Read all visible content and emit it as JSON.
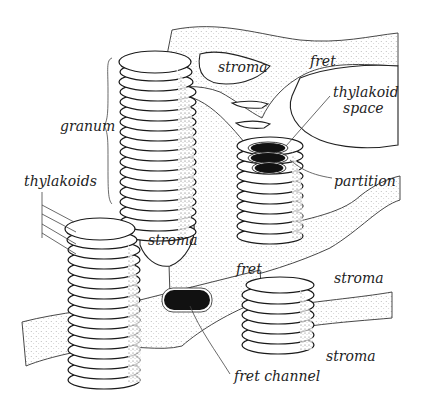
{
  "figure": {
    "labels": {
      "granum": "granum",
      "thylakoids": "thylakoids",
      "stroma_top": "stroma",
      "fret_top": "fret",
      "thylakoid_space_line1": "thylakoid",
      "thylakoid_space_line2": "space",
      "partition": "partition",
      "stroma_middle": "stroma",
      "fret_middle": "fret",
      "stroma_right": "stroma",
      "stroma_bottom_right": "stroma",
      "fret_channel": "fret channel"
    },
    "colors": {
      "ink": "#222222",
      "background": "#ffffff",
      "lumen_fill": "#111111"
    }
  }
}
